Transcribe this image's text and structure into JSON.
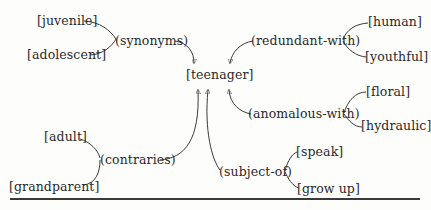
{
  "diagram": {
    "type": "semantic-network",
    "center": {
      "label": "[teenager]"
    },
    "relations": [
      {
        "label": "(synonyms)",
        "targets": [
          "[juvenile]",
          "[adolescent]"
        ]
      },
      {
        "label": "(redundant-with)",
        "targets": [
          "[human]",
          "[youthful]"
        ]
      },
      {
        "label": "(anomalous-with)",
        "targets": [
          "[floral]",
          "[hydraulic]"
        ]
      },
      {
        "label": "(contraries)",
        "targets": [
          "[adult]",
          "[grandparent]"
        ]
      },
      {
        "label": "(subject-of)",
        "targets": [
          "[speak]",
          "[grow up]"
        ]
      }
    ]
  },
  "nodes": {
    "teenager": "[teenager]",
    "synonyms": "(synonyms)",
    "juvenile": "[juvenile]",
    "adolescent": "[adolescent]",
    "redundant_with": "(redundant-with)",
    "human": "[human]",
    "youthful": "[youthful]",
    "anomalous_with": "(anomalous-with)",
    "floral": "[floral]",
    "hydraulic": "[hydraulic]",
    "contraries": "(contraries)",
    "adult": "[adult]",
    "grandparent": "[grandparent]",
    "subject_of": "(subject-of)",
    "speak": "[speak]",
    "grow_up": "[grow up]"
  }
}
